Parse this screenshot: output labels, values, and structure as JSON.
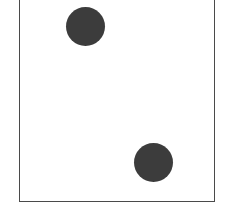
{
  "figure": {
    "pip_count": 2,
    "pip_color": "#3c3c3c",
    "border_color": "#4a4a4a",
    "pips": [
      {
        "cx": 85,
        "cy": 27,
        "r": 19.5
      },
      {
        "cx": 153,
        "cy": 161,
        "r": 19
      }
    ]
  }
}
